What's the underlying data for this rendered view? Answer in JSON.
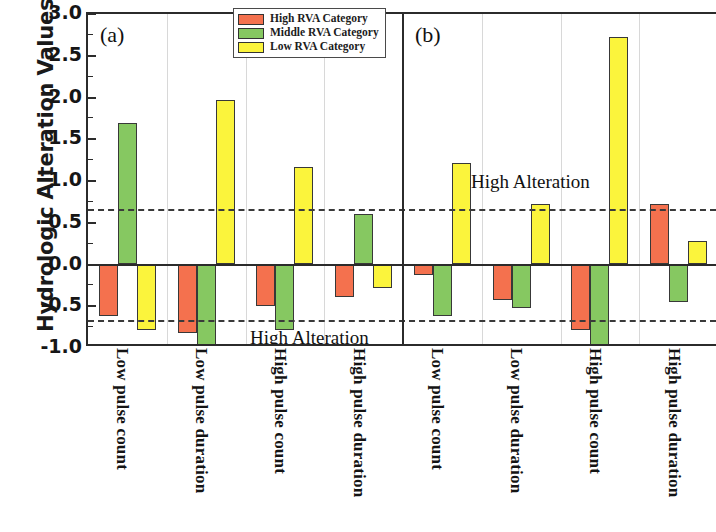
{
  "figure": {
    "ylabel": "Hydrologic Alteration Values",
    "panel_a_tag": "(a)",
    "panel_b_tag": "(b)",
    "annotation_lower": "High Alteration",
    "annotation_upper": "High Alteration"
  },
  "legend": {
    "items": [
      {
        "label": "High RVA Category",
        "color": "#F4714E"
      },
      {
        "label": "Middle RVA Category",
        "color": "#86C861"
      },
      {
        "label": "Low RVA Category",
        "color": "#FBF43C"
      }
    ]
  },
  "yticks": [
    {
      "label": "3.0",
      "value": 3.0
    },
    {
      "label": "2.5",
      "value": 2.5
    },
    {
      "label": "2.0",
      "value": 2.0
    },
    {
      "label": "1.5",
      "value": 1.5
    },
    {
      "label": "1.0",
      "value": 1.0
    },
    {
      "label": "0.5",
      "value": 0.5
    },
    {
      "label": "0.0",
      "value": 0.0
    },
    {
      "label": "-0.5",
      "value": -0.5
    },
    {
      "label": "-1.0",
      "value": -1.0
    }
  ],
  "chart_data": {
    "type": "bar",
    "title": "",
    "xlabel": "",
    "ylabel": "Hydrologic Alteration Values",
    "ylim": [
      -1.0,
      3.0
    ],
    "ytick_step": 0.5,
    "grid": false,
    "legend_position": "top-center",
    "reference_lines": [
      {
        "value": 0.67,
        "style": "dashed",
        "label": "High Alteration"
      },
      {
        "value": -0.67,
        "style": "dashed",
        "label": "High Alteration"
      }
    ],
    "panels": [
      {
        "tag": "(a)",
        "categories": [
          "Low pulse count",
          "Low pulse duration",
          "High pulse count",
          "High pulse duration"
        ],
        "series": [
          {
            "name": "High RVA Category",
            "color": "#F4714E",
            "values": [
              -0.62,
              -0.82,
              -0.5,
              -0.39
            ]
          },
          {
            "name": "Middle RVA Category",
            "color": "#86C861",
            "values": [
              1.7,
              -1.18,
              -0.79,
              0.6
            ]
          },
          {
            "name": "Low RVA Category",
            "color": "#FBF43C",
            "values": [
              -0.78,
              1.97,
              1.17,
              -0.28
            ]
          }
        ]
      },
      {
        "tag": "(b)",
        "categories": [
          "Low pulse count",
          "Low pulse duration",
          "High pulse count",
          "High pulse duration"
        ],
        "series": [
          {
            "name": "High RVA Category",
            "color": "#F4714E",
            "values": [
              -0.12,
              -0.43,
              -0.78,
              0.72
            ]
          },
          {
            "name": "Middle RVA Category",
            "color": "#86C861",
            "values": [
              -0.62,
              -0.52,
              -1.15,
              -0.45
            ]
          },
          {
            "name": "Low RVA Category",
            "color": "#FBF43C",
            "values": [
              1.22,
              0.72,
              2.73,
              0.28
            ]
          }
        ]
      }
    ]
  }
}
